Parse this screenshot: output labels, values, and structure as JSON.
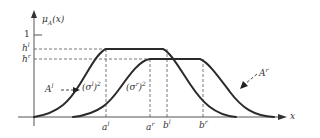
{
  "figure": {
    "y_axis_label": "μ",
    "y_axis_label_sub": "A",
    "y_axis_label_arg": "(x)",
    "x_axis_label": "x",
    "y_ticks": {
      "one": "1",
      "h_l": "h",
      "h_l_sup": "l",
      "h_r": "h",
      "h_r_sup": "r"
    },
    "x_ticks": {
      "a_l": "a",
      "a_l_sup": "l",
      "a_r": "a",
      "a_r_sup": "r",
      "b_l": "b",
      "b_l_sup": "l",
      "b_r": "b",
      "b_r_sup": "r"
    },
    "curves": {
      "lower": {
        "name": "A",
        "sup": "l",
        "sigma_label": "(σ",
        "sigma_sup": "l",
        "sigma_close": ")",
        "sigma_pow": "2"
      },
      "upper": {
        "name": "A",
        "sup": "r",
        "sigma_label": "(σ",
        "sigma_sup": "r",
        "sigma_close": ")",
        "sigma_pow": "2"
      }
    },
    "colors": {
      "curve": "#2a2a2a",
      "axis": "#555555",
      "dashed": "#555555",
      "text": "#333333"
    }
  }
}
